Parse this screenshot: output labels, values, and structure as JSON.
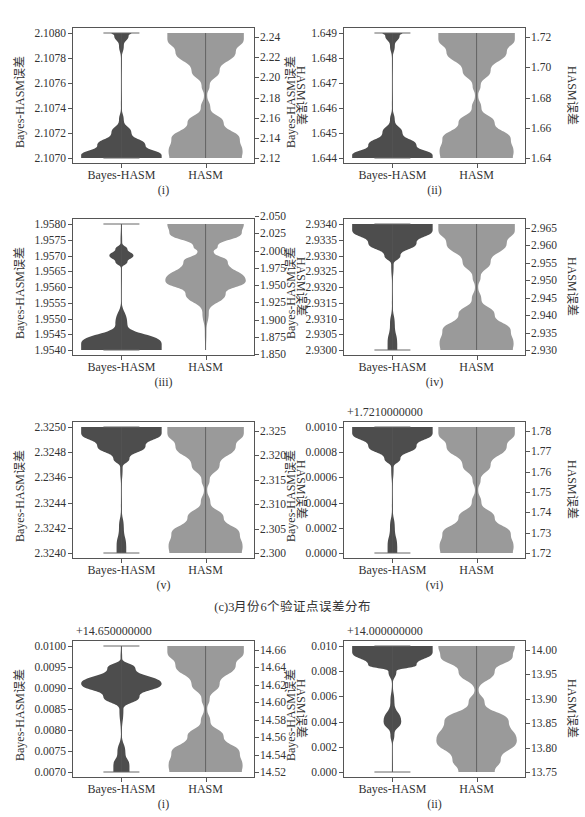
{
  "figure": {
    "caption": "(c)3月份6个验证点误差分布",
    "colors": {
      "bayes_fill": "#4d4d4d",
      "hasm_fill": "#9a9a9a",
      "axis": "#555555",
      "text": "#333333"
    }
  },
  "chart_data": [
    {
      "type": "violin",
      "panel_label": "(i)",
      "group": "c",
      "categories": [
        "Bayes-HASM",
        "HASM"
      ],
      "ylabel_left": "Bayes-HASM误差",
      "ylabel_right": "HASM误差",
      "left_ticks": [
        "2.1080",
        "2.1078",
        "2.1076",
        "2.1074",
        "2.1072",
        "2.1070"
      ],
      "right_ticks": [
        "2.24",
        "2.22",
        "2.20",
        "2.18",
        "2.16",
        "2.14",
        "2.12"
      ],
      "ylim_left": [
        2.107,
        2.108
      ],
      "ylim_right": [
        2.105,
        2.245
      ],
      "offset_text": "",
      "bayes_density": "bottom-heavy with thin neck, small lobe at top",
      "hasm_density": "hourglass: wide at top and bottom, pinched near 2.175"
    },
    {
      "type": "violin",
      "panel_label": "(ii)",
      "group": "c",
      "categories": [
        "Bayes-HASM",
        "HASM"
      ],
      "ylabel_left": "Bayes-HASM误差",
      "ylabel_right": "HASM误差",
      "left_ticks": [
        "1.649",
        "1.648",
        "1.647",
        "1.646",
        "1.645",
        "1.644"
      ],
      "right_ticks": [
        "1.72",
        "1.70",
        "1.68",
        "1.66",
        "1.64"
      ],
      "ylim_left": [
        1.644,
        1.649
      ],
      "ylim_right": [
        1.64,
        1.735
      ],
      "offset_text": "",
      "bayes_density": "bottom-heavy, thin neck, small lobe at top",
      "hasm_density": "hourglass pinched near 1.69"
    },
    {
      "type": "violin",
      "panel_label": "(iii)",
      "group": "c",
      "categories": [
        "Bayes-HASM",
        "HASM"
      ],
      "ylabel_left": "Bayes-HASM误差",
      "ylabel_right": "HASM误差",
      "left_ticks": [
        "1.9580",
        "1.9575",
        "1.9570",
        "1.9565",
        "1.9560",
        "1.9555",
        "1.9550",
        "1.9545",
        "1.9540"
      ],
      "right_ticks": [
        "2.050",
        "2.025",
        "2.000",
        "1.975",
        "1.950",
        "1.925",
        "1.900",
        "1.875",
        "1.850"
      ],
      "ylim_left": [
        1.954,
        1.958
      ],
      "ylim_right": [
        1.85,
        2.05
      ],
      "offset_text": "",
      "bayes_density": "bottom-heavy, small lobe near 1.9570",
      "hasm_density": "wide top, pinch near 2.000, wide bulge near 1.955, thin tail to 1.850"
    },
    {
      "type": "violin",
      "panel_label": "(iv)",
      "group": "c",
      "categories": [
        "Bayes-HASM",
        "HASM"
      ],
      "ylabel_left": "Bayes-HASM误差",
      "ylabel_right": "HASM误差",
      "left_ticks": [
        "2.9340",
        "2.9335",
        "2.9330",
        "2.9325",
        "2.9320",
        "2.9315",
        "2.9310",
        "2.9305",
        "2.9300"
      ],
      "right_ticks": [
        "2.965",
        "2.960",
        "2.955",
        "2.950",
        "2.945",
        "2.940",
        "2.935",
        "2.930"
      ],
      "ylim_left": [
        2.93,
        2.934
      ],
      "ylim_right": [
        2.93,
        2.966
      ],
      "offset_text": "",
      "bayes_density": "top-heavy, thin neck, small lobe at bottom",
      "hasm_density": "hourglass pinched near 2.948"
    },
    {
      "type": "violin",
      "panel_label": "(v)",
      "group": "c",
      "categories": [
        "Bayes-HASM",
        "HASM"
      ],
      "ylabel_left": "Bayes-HASM误差",
      "ylabel_right": "HASM误差",
      "left_ticks": [
        "2.3250",
        "2.3248",
        "2.2346",
        "2.3244",
        "2.3242",
        "2.3240"
      ],
      "right_ticks": [
        "2.325",
        "2.320",
        "2.315",
        "2.310",
        "2.305",
        "2.300"
      ],
      "ylim_left": [
        2.324,
        2.325
      ],
      "ylim_right": [
        2.3,
        2.325
      ],
      "offset_text": "",
      "bayes_density": "top-heavy, thin neck, small lobe at bottom",
      "hasm_density": "hourglass pinched near 2.312"
    },
    {
      "type": "violin",
      "panel_label": "(vi)",
      "group": "c",
      "categories": [
        "Bayes-HASM",
        "HASM"
      ],
      "ylabel_left": "Bayes-HASM误差",
      "ylabel_right": "HASM误差",
      "left_ticks": [
        "0.0010",
        "0.0008",
        "0.0006",
        "0.0004",
        "0.0002",
        "0.0000"
      ],
      "right_ticks": [
        "1.78",
        "1.77",
        "1.76",
        "1.75",
        "1.74",
        "1.73",
        "1.72"
      ],
      "ylim_left": [
        0.0,
        0.001
      ],
      "ylim_right": [
        1.72,
        1.784
      ],
      "offset_text": "+1.7210000000",
      "bayes_density": "top-heavy, thin neck, small lobe at bottom",
      "hasm_density": "hourglass pinched near 1.752"
    },
    {
      "type": "violin",
      "panel_label": "(i)",
      "group": "d",
      "categories": [
        "Bayes-HASM",
        "HASM"
      ],
      "ylabel_left": "Bayes-HASM误差",
      "ylabel_right": "HASM误差",
      "left_ticks": [
        "0.0100",
        "0.0095",
        "0.0090",
        "0.0085",
        "0.0080",
        "0.0075",
        "0.0070"
      ],
      "right_ticks": [
        "14.66",
        "14.64",
        "14.62",
        "14.60",
        "14.58",
        "14.56",
        "14.54",
        "14.52"
      ],
      "ylim_left": [
        0.007,
        0.01
      ],
      "ylim_right": [
        14.52,
        14.67
      ],
      "offset_text": "+14.650000000",
      "bayes_density": "wide lobe centered near 0.0090, small lobe at bottom",
      "hasm_density": "hourglass pinched near 14.59"
    },
    {
      "type": "violin",
      "panel_label": "(ii)",
      "group": "d",
      "categories": [
        "Bayes-HASM",
        "HASM"
      ],
      "ylabel_left": "Bayes-HASM误差",
      "ylabel_right": "HASM误差",
      "left_ticks": [
        "0.010",
        "0.008",
        "0.006",
        "0.004",
        "0.002",
        "0.000"
      ],
      "right_ticks": [
        "14.00",
        "13.95",
        "13.90",
        "13.85",
        "13.80",
        "13.75"
      ],
      "ylim_left": [
        0.0,
        0.01
      ],
      "ylim_right": [
        13.735,
        14.005
      ],
      "offset_text": "+14.000000000",
      "bayes_density": "top-heavy, small lobe near 0.004",
      "hasm_density": "wide top, pinch near 13.89, wide bulge near 13.80"
    }
  ]
}
